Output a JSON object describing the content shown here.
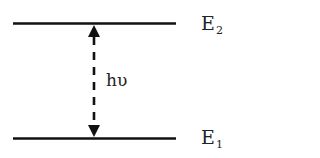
{
  "diagram": {
    "levels": [
      {
        "id": "upper",
        "symbol": "E",
        "subscript": "2",
        "y": 23
      },
      {
        "id": "lower",
        "symbol": "E",
        "subscript": "1",
        "y": 138
      }
    ],
    "transition": {
      "label": "hυ",
      "style": "dashed",
      "arrowheads": "both"
    },
    "colors": {
      "line": "#111111",
      "text": "#222222",
      "background": "#ffffff"
    }
  }
}
